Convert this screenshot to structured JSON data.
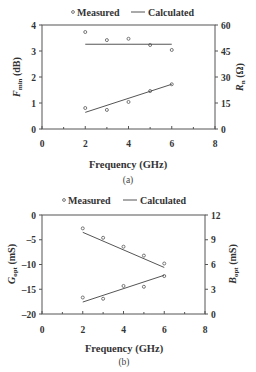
{
  "chart_data": [
    {
      "id": "a",
      "type": "scatter",
      "caption": "(a)",
      "legend": {
        "measured": "Measured",
        "calculated": "Calculated",
        "position": "top"
      },
      "xlabel": "Frequency (GHz)",
      "ylabel_left": "F_min (dB)",
      "ylabel_right": "R_n (Ω)",
      "xlim": [
        0,
        8
      ],
      "xticks": [
        0,
        2,
        4,
        6,
        8
      ],
      "ylim_left": [
        0,
        4
      ],
      "yticks_left": [
        0,
        1,
        2,
        3,
        4
      ],
      "ylim_right": [
        0,
        60
      ],
      "yticks_right": [
        0,
        15,
        30,
        45,
        60
      ],
      "grid": false,
      "series": [
        {
          "name": "F_min measured",
          "axis": "left",
          "kind": "measured",
          "x": [
            2,
            3,
            4,
            5,
            6
          ],
          "y": [
            3.73,
            3.42,
            3.47,
            3.23,
            3.04
          ]
        },
        {
          "name": "F_min calculated",
          "axis": "left",
          "kind": "calculated",
          "x": [
            2,
            6
          ],
          "y": [
            3.26,
            3.26
          ]
        },
        {
          "name": "R_n measured",
          "axis": "right",
          "kind": "measured",
          "x": [
            2,
            3,
            4,
            5,
            6
          ],
          "y": [
            12.1,
            11.0,
            15.6,
            21.9,
            25.8
          ]
        },
        {
          "name": "R_n calculated",
          "axis": "right",
          "kind": "calculated",
          "x": [
            2,
            6
          ],
          "y": [
            9.6,
            25.8
          ]
        }
      ]
    },
    {
      "id": "b",
      "type": "scatter",
      "caption": "(b)",
      "legend": {
        "measured": "Measured",
        "calculated": "Calculated",
        "position": "top"
      },
      "xlabel": "Frequency (GHz)",
      "ylabel_left": "G_opt (mS)",
      "ylabel_right": "B_opt (mS)",
      "xlim": [
        0,
        8
      ],
      "xticks": [
        0,
        2,
        4,
        6,
        8
      ],
      "ylim_left": [
        -20,
        0
      ],
      "yticks_left": [
        -20,
        -15,
        -10,
        -5,
        0
      ],
      "ylim_right": [
        0,
        12
      ],
      "yticks_right": [
        0,
        3,
        6,
        9,
        12
      ],
      "grid": false,
      "series": [
        {
          "name": "G_opt measured",
          "axis": "left",
          "kind": "measured",
          "x": [
            2,
            3,
            4,
            5,
            6
          ],
          "y": [
            -2.7,
            -4.6,
            -6.4,
            -8.2,
            -9.8
          ]
        },
        {
          "name": "G_opt calculated",
          "axis": "left",
          "kind": "calculated",
          "x": [
            2,
            6
          ],
          "y": [
            -3.5,
            -10.6
          ]
        },
        {
          "name": "B_opt measured",
          "axis": "right",
          "kind": "measured",
          "x": [
            2,
            3,
            4,
            5,
            6
          ],
          "y": [
            2.0,
            1.85,
            3.4,
            3.3,
            4.6
          ]
        },
        {
          "name": "B_opt calculated",
          "axis": "right",
          "kind": "calculated",
          "x": [
            2,
            6
          ],
          "y": [
            1.45,
            4.7
          ]
        }
      ]
    }
  ],
  "labels": {
    "a": {
      "legend_measured": "Measured",
      "legend_calculated": "Calculated",
      "ylabel_left_main": "F",
      "ylabel_left_sub": "min",
      "ylabel_left_unit": " (dB)",
      "ylabel_right_main": "R",
      "ylabel_right_sub": "n",
      "ylabel_right_unit": " (Ω)",
      "xlabel": "Frequency (GHz)",
      "caption": "(a)"
    },
    "b": {
      "legend_measured": "Measured",
      "legend_calculated": "Calculated",
      "ylabel_left_main": "G",
      "ylabel_left_sub": "opt",
      "ylabel_left_unit": " (mS)",
      "ylabel_right_main": "B",
      "ylabel_right_sub": "opt",
      "ylabel_right_unit": " (mS)",
      "xlabel": "Frequency (GHz)",
      "caption": "(b)"
    }
  }
}
